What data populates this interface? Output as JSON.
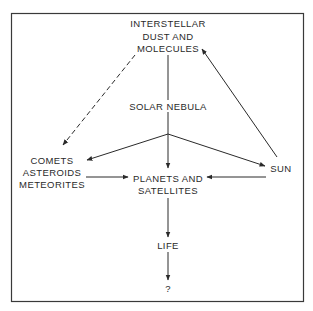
{
  "diagram": {
    "nodes": {
      "interstellar": {
        "lines": [
          "INTERSTELLAR",
          "DUST AND",
          "MOLECULES"
        ]
      },
      "solar_nebula": {
        "lines": [
          "SOLAR NEBULA"
        ]
      },
      "comets": {
        "lines": [
          "COMETS",
          "ASTEROIDS",
          "METEORITES"
        ]
      },
      "planets": {
        "lines": [
          "PLANETS AND",
          "SATELLITES"
        ]
      },
      "sun": {
        "lines": [
          "SUN"
        ]
      },
      "life": {
        "lines": [
          "LIFE"
        ]
      },
      "unknown": {
        "lines": [
          "?"
        ]
      }
    },
    "edges": [
      {
        "from": "interstellar",
        "to": "solar_nebula",
        "style": "solid",
        "arrow": false
      },
      {
        "from": "interstellar",
        "to": "comets",
        "style": "dashed",
        "arrow": true
      },
      {
        "from": "solar_nebula",
        "to": "comets",
        "style": "solid",
        "arrow": true
      },
      {
        "from": "solar_nebula",
        "to": "planets",
        "style": "solid",
        "arrow": true
      },
      {
        "from": "solar_nebula",
        "to": "sun",
        "style": "solid",
        "arrow": true
      },
      {
        "from": "sun",
        "to": "interstellar",
        "style": "solid",
        "arrow": true
      },
      {
        "from": "comets",
        "to": "planets",
        "style": "solid",
        "arrow": true
      },
      {
        "from": "sun",
        "to": "planets",
        "style": "solid",
        "arrow": true
      },
      {
        "from": "planets",
        "to": "life",
        "style": "solid",
        "arrow": true
      },
      {
        "from": "life",
        "to": "unknown",
        "style": "solid",
        "arrow": true
      }
    ],
    "colors": {
      "line": "#2a2a2a",
      "border": "#3a3a3a",
      "background": "#ffffff"
    }
  }
}
